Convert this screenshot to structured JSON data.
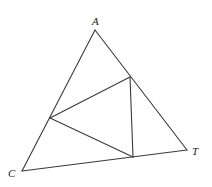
{
  "diagram": {
    "type": "geometry",
    "vertices": {
      "A": {
        "label": "A",
        "x": 95,
        "y": 30,
        "label_x": 92,
        "label_y": 25
      },
      "C": {
        "label": "C",
        "x": 22,
        "y": 171,
        "label_x": 8,
        "label_y": 177
      },
      "T": {
        "label": "T",
        "x": 187,
        "y": 150,
        "label_x": 192,
        "label_y": 155
      }
    },
    "inner_points": {
      "P_AT": {
        "x": 130,
        "y": 77
      },
      "P_AC": {
        "x": 50,
        "y": 118
      },
      "P_CT": {
        "x": 133,
        "y": 157
      }
    },
    "outer_triangle": [
      "A",
      "C",
      "T"
    ],
    "inner_triangle": [
      "P_AT",
      "P_AC",
      "P_CT"
    ],
    "colors": {
      "stroke": "#3a3a3a",
      "label": "#222222",
      "background": "#ffffff"
    }
  }
}
